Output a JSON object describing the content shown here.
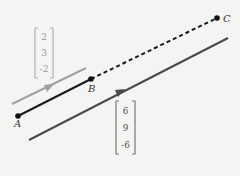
{
  "points": [
    {
      "label": "A",
      "x": 18,
      "y": 116
    },
    {
      "label": "B",
      "x": 91,
      "y": 79
    },
    {
      "label": "C",
      "x": 217,
      "y": 18
    }
  ],
  "vectors": {
    "upper": {
      "components": [
        "2",
        "3",
        "-2"
      ],
      "color": "#9a9a9a"
    },
    "lower": {
      "components": [
        "6",
        "9",
        "-6"
      ],
      "color": "#555555"
    }
  },
  "colors": {
    "segment_ab": "#1a1a1a",
    "dashed_bc": "#1a1a1a",
    "upper_line": "#a0a0a0",
    "lower_line": "#4a4a4a"
  }
}
